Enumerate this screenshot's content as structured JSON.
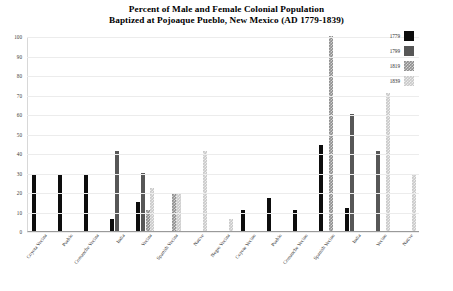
{
  "title": {
    "line1": "Percent of Male and Female Colonial Population",
    "line2": "Baptized at Pojoaque Pueblo, New Mexico (AD 1779-1839)"
  },
  "legend": {
    "position": "top-right",
    "entries": [
      {
        "label": "1779",
        "swatch": "legend-swatch-1779"
      },
      {
        "label": "1799",
        "swatch": "legend-swatch-1799"
      },
      {
        "label": "1819",
        "swatch": "legend-swatch-1819"
      },
      {
        "label": "1839",
        "swatch": "legend-swatch-1839"
      }
    ]
  },
  "axis": {
    "y_ticks": [
      "0",
      "10",
      "20",
      "30",
      "40",
      "50",
      "60",
      "70",
      "80",
      "90",
      "100"
    ],
    "y_min": 0,
    "y_max": 100,
    "grid": true
  },
  "chart_data": {
    "type": "bar",
    "title": "Percent of Male and Female Colonial Population Baptized at Pojoaque Pueblo, New Mexico (AD 1779-1839)",
    "xlabel": "",
    "ylabel": "",
    "ylim": [
      0,
      100
    ],
    "grid": true,
    "legend_position": "top-right",
    "categories": [
      "Coyota Vecina",
      "Pueblo",
      "Comanche Vecina",
      "India",
      "Vecina",
      "Spanish Vecina",
      "Native",
      "Negro Vecina",
      "Coyote Vecino",
      "Pueblo",
      "Comanche Vecino",
      "Spanish Vecino",
      "India",
      "Vecino",
      "Native"
    ],
    "series": [
      {
        "name": "1779",
        "color": "#0d0d0d",
        "values": [
          29,
          29,
          29,
          6,
          15,
          0,
          0,
          0,
          11,
          17,
          11,
          44,
          12,
          0,
          0
        ]
      },
      {
        "name": "1799",
        "color": "#575757",
        "values": [
          0,
          0,
          0,
          41,
          30,
          0,
          0,
          0,
          0,
          0,
          0,
          0,
          60,
          41,
          0
        ]
      },
      {
        "name": "1819",
        "color": "#8f8f8f",
        "values": [
          0,
          0,
          0,
          0,
          11,
          19,
          0,
          0,
          0,
          0,
          0,
          100,
          0,
          0,
          0
        ]
      },
      {
        "name": "1839",
        "color": "#c9c9c9",
        "values": [
          0,
          0,
          0,
          0,
          22,
          19,
          41,
          6,
          0,
          0,
          0,
          0,
          0,
          71,
          29
        ]
      }
    ]
  }
}
